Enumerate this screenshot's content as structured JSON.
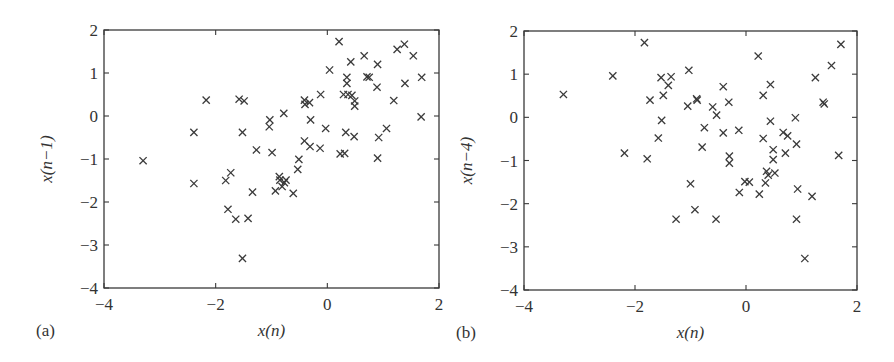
{
  "chart_data": [
    {
      "type": "scatter",
      "panel_label": "(a)",
      "title": "",
      "xlabel": "x(n)",
      "ylabel": "x(n−1)",
      "xlim": [
        -4,
        2
      ],
      "ylim": [
        -4,
        2
      ],
      "xticks": [
        -4,
        -2,
        0,
        2
      ],
      "yticks": [
        -4,
        -3,
        -2,
        -1,
        0,
        1,
        2
      ],
      "xtick_labels": [
        "−4",
        "−2",
        "0",
        "2"
      ],
      "ytick_labels": [
        "−4",
        "−3",
        "−2",
        "−1",
        "0",
        "1",
        "2"
      ],
      "grid": false,
      "marker": "x",
      "points": [
        [
          -3.3,
          -1.04
        ],
        [
          -2.39,
          -0.38
        ],
        [
          -2.39,
          -1.57
        ],
        [
          -2.17,
          0.37
        ],
        [
          -1.58,
          0.39
        ],
        [
          -1.49,
          0.35
        ],
        [
          -1.52,
          -0.38
        ],
        [
          -1.52,
          -3.31
        ],
        [
          -1.82,
          -1.5
        ],
        [
          -1.73,
          -1.32
        ],
        [
          -1.78,
          -2.17
        ],
        [
          -1.64,
          -2.4
        ],
        [
          -1.42,
          -2.38
        ],
        [
          -1.34,
          -1.77
        ],
        [
          -1.27,
          -0.79
        ],
        [
          -1.03,
          -0.09
        ],
        [
          -1.04,
          -0.25
        ],
        [
          -0.99,
          -0.85
        ],
        [
          -0.78,
          0.06
        ],
        [
          -0.93,
          -1.74
        ],
        [
          -0.86,
          -1.41
        ],
        [
          -0.85,
          -1.49
        ],
        [
          -0.77,
          -1.55
        ],
        [
          -0.74,
          -1.49
        ],
        [
          -0.81,
          -1.64
        ],
        [
          -0.61,
          -1.8
        ],
        [
          -0.53,
          -1.24
        ],
        [
          -0.51,
          -1.01
        ],
        [
          -0.41,
          0.37
        ],
        [
          -0.4,
          0.27
        ],
        [
          -0.32,
          0.31
        ],
        [
          -0.3,
          -0.09
        ],
        [
          -0.41,
          -0.58
        ],
        [
          -0.31,
          -0.71
        ],
        [
          -0.13,
          -0.75
        ],
        [
          -0.12,
          0.5
        ],
        [
          -0.03,
          -0.29
        ],
        [
          0.04,
          1.07
        ],
        [
          0.21,
          1.73
        ],
        [
          0.23,
          -0.88
        ],
        [
          0.31,
          -0.87
        ],
        [
          0.29,
          0.5
        ],
        [
          0.35,
          0.9
        ],
        [
          0.35,
          0.76
        ],
        [
          0.37,
          0.5
        ],
        [
          0.33,
          -0.38
        ],
        [
          0.42,
          1.26
        ],
        [
          0.44,
          0.48
        ],
        [
          0.48,
          -0.48
        ],
        [
          0.49,
          0.35
        ],
        [
          0.49,
          0.23
        ],
        [
          0.66,
          1.4
        ],
        [
          0.71,
          0.91
        ],
        [
          0.75,
          0.9
        ],
        [
          0.89,
          0.67
        ],
        [
          0.9,
          1.2
        ],
        [
          0.92,
          -0.5
        ],
        [
          0.9,
          -0.98
        ],
        [
          1.06,
          -0.29
        ],
        [
          1.19,
          0.36
        ],
        [
          1.25,
          1.55
        ],
        [
          1.38,
          1.67
        ],
        [
          1.39,
          0.76
        ],
        [
          1.54,
          1.4
        ],
        [
          1.69,
          0.9
        ],
        [
          1.68,
          -0.02
        ]
      ]
    },
    {
      "type": "scatter",
      "panel_label": "(b)",
      "title": "",
      "xlabel": "x(n)",
      "ylabel": "x(n−4)",
      "xlim": [
        -4,
        2
      ],
      "ylim": [
        -4,
        2
      ],
      "xticks": [
        -4,
        -2,
        0,
        2
      ],
      "yticks": [
        -4,
        -3,
        -2,
        -1,
        0,
        1,
        2
      ],
      "xtick_labels": [
        "−4",
        "−2",
        "0",
        "2"
      ],
      "ytick_labels": [
        "−4",
        "−3",
        "−2",
        "−1",
        "0",
        "1",
        "2"
      ],
      "grid": false,
      "marker": "x",
      "points": [
        [
          -3.29,
          0.53
        ],
        [
          -2.4,
          0.96
        ],
        [
          -1.83,
          1.73
        ],
        [
          -2.19,
          -0.83
        ],
        [
          -1.78,
          -0.96
        ],
        [
          -1.73,
          0.4
        ],
        [
          -1.53,
          0.92
        ],
        [
          -1.49,
          0.51
        ],
        [
          -1.4,
          0.74
        ],
        [
          -1.35,
          0.94
        ],
        [
          -1.52,
          -0.07
        ],
        [
          -1.58,
          -0.48
        ],
        [
          -1.26,
          -2.36
        ],
        [
          -1.03,
          1.09
        ],
        [
          -1.05,
          0.26
        ],
        [
          -0.89,
          0.43
        ],
        [
          -0.88,
          0.4
        ],
        [
          -1.0,
          -1.54
        ],
        [
          -0.92,
          -2.14
        ],
        [
          -0.79,
          -0.69
        ],
        [
          -0.75,
          -0.24
        ],
        [
          -0.6,
          0.24
        ],
        [
          -0.53,
          0.05
        ],
        [
          -0.54,
          -2.36
        ],
        [
          -0.41,
          0.71
        ],
        [
          -0.41,
          -0.36
        ],
        [
          -0.31,
          0.35
        ],
        [
          -0.3,
          -0.9
        ],
        [
          -0.3,
          -1.06
        ],
        [
          -0.13,
          -0.3
        ],
        [
          -0.12,
          -1.74
        ],
        [
          -0.02,
          -1.49
        ],
        [
          0.06,
          -1.5
        ],
        [
          0.22,
          1.42
        ],
        [
          0.24,
          -1.78
        ],
        [
          0.31,
          0.51
        ],
        [
          0.31,
          -0.49
        ],
        [
          0.35,
          -1.52
        ],
        [
          0.37,
          -1.25
        ],
        [
          0.4,
          -1.34
        ],
        [
          0.44,
          0.76
        ],
        [
          0.44,
          -0.09
        ],
        [
          0.49,
          -0.75
        ],
        [
          0.49,
          -0.98
        ],
        [
          0.52,
          -1.29
        ],
        [
          0.67,
          -0.35
        ],
        [
          0.75,
          -0.43
        ],
        [
          0.71,
          -0.83
        ],
        [
          0.89,
          -0.01
        ],
        [
          0.91,
          -0.62
        ],
        [
          0.93,
          -1.66
        ],
        [
          0.91,
          -2.36
        ],
        [
          1.06,
          -3.27
        ],
        [
          1.19,
          -1.83
        ],
        [
          1.25,
          0.92
        ],
        [
          1.39,
          0.35
        ],
        [
          1.41,
          0.31
        ],
        [
          1.54,
          1.2
        ],
        [
          1.67,
          -0.88
        ],
        [
          1.71,
          1.69
        ]
      ]
    }
  ],
  "colors": {
    "ink": "#3a3a3a",
    "background": "#ffffff"
  }
}
